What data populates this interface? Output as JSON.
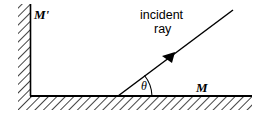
{
  "figure": {
    "background_color": "#ffffff",
    "ink_color": "#000000",
    "labels": {
      "vertical_mirror": "M'",
      "horizontal_mirror": "M",
      "angle": "θ",
      "ray_caption_line1": "incident",
      "ray_caption_line2": "ray"
    },
    "icons": {
      "arrowhead": "arrowhead-icon",
      "angle_arc": "angle-arc-icon",
      "hatch_vertical": "hatching-icon",
      "hatch_horizontal": "hatching-icon"
    },
    "geometry": {
      "surface_line_y": 96,
      "vertical_mirror_x": 30,
      "incidence_point_x": 118,
      "incidence_point_y": 96,
      "ray_tip_x": 233,
      "ray_tip_y": 10,
      "angle_degrees": 39
    }
  }
}
